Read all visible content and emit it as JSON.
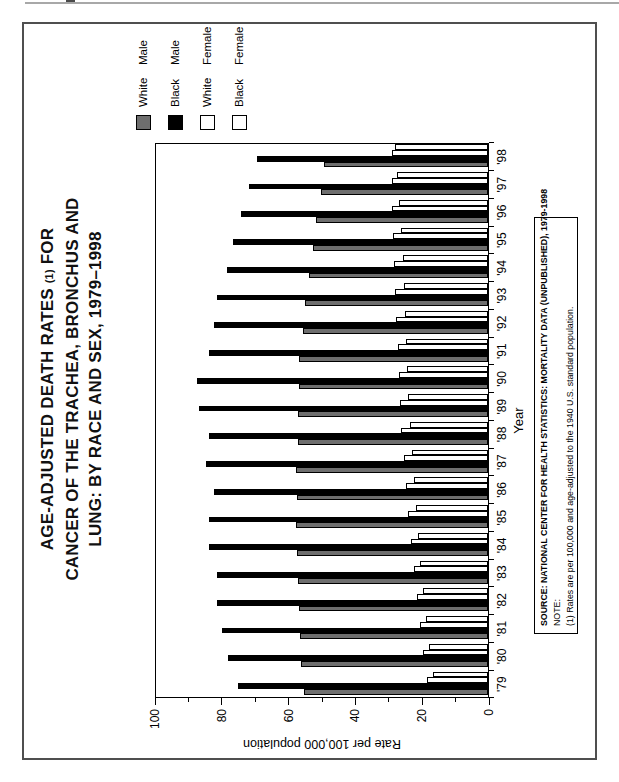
{
  "chart_data": {
    "type": "bar",
    "title_lines": [
      "AGE-ADJUSTED DEATH RATES (1) FOR",
      "CANCER OF THE TRACHEA, BRONCHUS AND",
      "LUNG: BY RACE AND SEX, 1979–1998"
    ],
    "xlabel": "Year",
    "ylabel": "Rate per 100,000 population",
    "ylim": [
      0,
      100
    ],
    "ymajor_step": 20,
    "yminor_step": 10,
    "grid": false,
    "legend_position": "top-right",
    "orientation_note": "landscape chart rotated 90 degrees counterclockwise on portrait page",
    "categories": [
      "'79",
      "'80",
      "'81",
      "'82",
      "'83",
      "'84",
      "'85",
      "'86",
      "'87",
      "'88",
      "'89",
      "'90",
      "'91",
      "'92",
      "'93",
      "'94",
      "'95",
      "'96",
      "'97",
      "'98"
    ],
    "series": [
      {
        "name": "White Male",
        "words": [
          "White",
          "Male"
        ],
        "fill": "#6e6e6e",
        "values": [
          55.2,
          55.9,
          56.3,
          56.6,
          56.9,
          57.2,
          57.4,
          57.3,
          57.5,
          57.0,
          56.8,
          56.6,
          56.5,
          55.5,
          54.8,
          53.5,
          52.5,
          51.5,
          49.9,
          49.2
        ]
      },
      {
        "name": "Black Male",
        "words": [
          "Black",
          "Male"
        ],
        "fill": "#000000",
        "values": [
          75.0,
          77.8,
          79.5,
          81.0,
          81.0,
          83.5,
          83.4,
          82.0,
          84.5,
          83.5,
          86.5,
          87.0,
          83.5,
          82.0,
          81.0,
          78.0,
          76.5,
          74.0,
          71.5,
          69.2
        ]
      },
      {
        "name": "White Female",
        "words": [
          "White",
          "Female"
        ],
        "fill": "#ffffff",
        "values": [
          18.2,
          19.4,
          20.4,
          21.2,
          22.3,
          23.1,
          24.0,
          24.6,
          25.3,
          26.0,
          26.4,
          26.7,
          27.1,
          27.5,
          27.8,
          28.0,
          28.3,
          28.6,
          28.6,
          28.7
        ]
      },
      {
        "name": "Black Female",
        "words": [
          "Black",
          "Female"
        ],
        "fill": "#ffffff",
        "values": [
          16.5,
          17.6,
          18.5,
          19.4,
          20.3,
          21.0,
          21.7,
          22.3,
          22.9,
          23.5,
          24.0,
          24.3,
          24.6,
          25.0,
          25.3,
          25.6,
          26.0,
          26.6,
          27.2,
          27.8
        ]
      }
    ]
  },
  "notes": {
    "source": "SOURCE: NATIONAL CENTER FOR HEALTH STATISTICS: MORTALITY DATA (UNPUBLISHED), 1979-1998",
    "note_label": "NOTE:",
    "note_1": "(1) Rates are per 100,000 and age-adjusted to the 1940 U.S. standard population."
  }
}
